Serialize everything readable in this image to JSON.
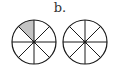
{
  "label": "b.",
  "colors": {
    "stroke": "#1a1a1a",
    "shade": "#c4c4c4",
    "fill": "#ffffff"
  },
  "circles": [
    {
      "name": "left-fraction-circle",
      "cx": 34,
      "cy": 42,
      "r": 22,
      "slices": 8,
      "shaded_slices": [
        7
      ]
    },
    {
      "name": "right-fraction-circle",
      "cx": 85,
      "cy": 42,
      "r": 22,
      "slices": 8,
      "shaded_slices": []
    }
  ]
}
